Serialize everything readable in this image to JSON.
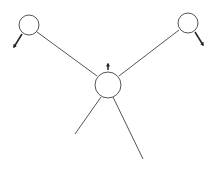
{
  "diagram": {
    "width": 212,
    "height": 169,
    "background": "#ffffff",
    "stroke": "#555555",
    "arrow_color": "#222222",
    "nodes": [
      {
        "id": "node-left",
        "cx": 29,
        "cy": 25,
        "r": 10
      },
      {
        "id": "node-right",
        "cx": 188,
        "cy": 23,
        "r": 10
      },
      {
        "id": "node-center",
        "cx": 108,
        "cy": 85,
        "r": 13
      }
    ],
    "edges": [
      {
        "id": "edge-left-center",
        "x1": 37,
        "y1": 32,
        "x2": 97,
        "y2": 76
      },
      {
        "id": "edge-right-center",
        "x1": 179,
        "y1": 30,
        "x2": 119,
        "y2": 76
      },
      {
        "id": "edge-center-lower-left",
        "x1": 101,
        "y1": 97,
        "x2": 75,
        "y2": 134
      },
      {
        "id": "edge-center-lower-right",
        "x1": 113,
        "y1": 97,
        "x2": 143,
        "y2": 159
      }
    ],
    "arrows": [
      {
        "id": "arrow-left-out",
        "x1": 22,
        "y1": 34,
        "x2": 14,
        "y2": 47,
        "direction": "down-left"
      },
      {
        "id": "arrow-right-out",
        "x1": 195,
        "y1": 32,
        "x2": 203,
        "y2": 45,
        "direction": "down-right"
      },
      {
        "id": "arrow-center-up",
        "x1": 108,
        "y1": 70,
        "x2": 108,
        "y2": 64,
        "direction": "up"
      }
    ]
  }
}
